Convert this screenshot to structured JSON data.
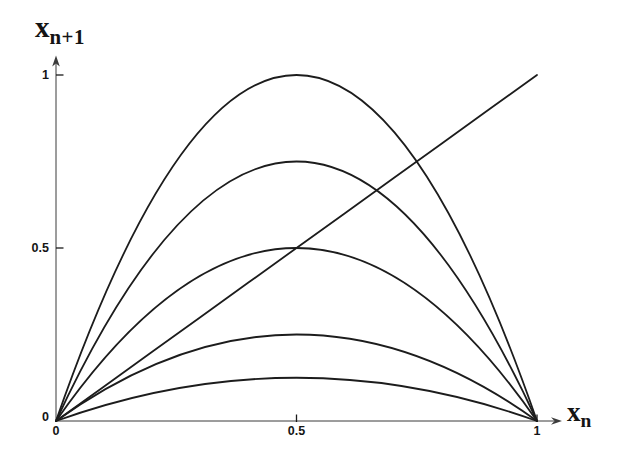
{
  "figure": {
    "background": "#ffffff",
    "curve_color": "#1c1c1c",
    "axis_color": "#3b3b3b",
    "tick_color": "#1a1a1a"
  },
  "axes": {
    "x": {
      "label_base": "x",
      "label_sub": "n",
      "range": [
        0,
        1
      ],
      "ticks": [
        {
          "value": 0,
          "label": "0"
        },
        {
          "value": 0.5,
          "label": "0.5"
        },
        {
          "value": 1,
          "label": "1"
        }
      ]
    },
    "y": {
      "label_base": "x",
      "label_sub": "n+1",
      "range": [
        0,
        1
      ],
      "ticks": [
        {
          "value": 0,
          "label": "0"
        },
        {
          "value": 0.5,
          "label": "0.5"
        },
        {
          "value": 1,
          "label": "1"
        }
      ]
    }
  },
  "chart_data": {
    "type": "line",
    "title": "",
    "xlabel": "x_n",
    "ylabel": "x_n+1",
    "xlim": [
      0,
      1
    ],
    "ylim": [
      0,
      1
    ],
    "grid": false,
    "legend": "none",
    "x_samples": [
      0,
      0.1,
      0.2,
      0.3,
      0.4,
      0.5,
      0.6,
      0.7,
      0.8,
      0.9,
      1
    ],
    "series": [
      {
        "key": "r4",
        "name": "r = 4",
        "r": 4,
        "peak": 1.0,
        "values": [
          0,
          0.36,
          0.64,
          0.84,
          0.96,
          1.0,
          0.96,
          0.84,
          0.64,
          0.36,
          0
        ]
      },
      {
        "key": "r3",
        "name": "r = 3",
        "r": 3,
        "peak": 0.75,
        "values": [
          0,
          0.27,
          0.48,
          0.63,
          0.72,
          0.75,
          0.72,
          0.63,
          0.48,
          0.27,
          0
        ]
      },
      {
        "key": "r2",
        "name": "r = 2",
        "r": 2,
        "peak": 0.5,
        "values": [
          0,
          0.18,
          0.32,
          0.42,
          0.48,
          0.5,
          0.48,
          0.42,
          0.32,
          0.18,
          0
        ]
      },
      {
        "key": "r1",
        "name": "r = 1",
        "r": 1,
        "peak": 0.25,
        "values": [
          0,
          0.09,
          0.16,
          0.21,
          0.24,
          0.25,
          0.24,
          0.21,
          0.16,
          0.09,
          0
        ]
      },
      {
        "key": "r05",
        "name": "r = 0.5",
        "r": 0.5,
        "peak": 0.125,
        "values": [
          0,
          0.045,
          0.08,
          0.105,
          0.12,
          0.125,
          0.12,
          0.105,
          0.08,
          0.045,
          0
        ]
      },
      {
        "key": "identity",
        "name": "identity line",
        "equation": "x_n+1 = x_n",
        "values": [
          0,
          0.1,
          0.2,
          0.3,
          0.4,
          0.5,
          0.6,
          0.7,
          0.8,
          0.9,
          1
        ]
      }
    ]
  }
}
